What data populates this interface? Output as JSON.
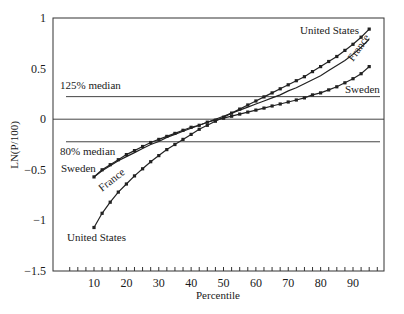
{
  "chart_data": {
    "type": "line",
    "title": "",
    "xlabel": "Percentile",
    "ylabel": "LN(P/100)",
    "xlim": [
      0,
      100
    ],
    "ylim": [
      -1.5,
      1
    ],
    "x_ticks": [
      10,
      20,
      30,
      40,
      50,
      60,
      70,
      80,
      90
    ],
    "x_tick_labels": [
      "10",
      "20",
      "30",
      "40",
      "50",
      "60",
      "70",
      "80",
      "90"
    ],
    "x_minor_step": 2.5,
    "y_ticks": [
      1,
      0.5,
      0,
      -0.5,
      -1,
      -1.5
    ],
    "y_tick_labels": [
      "1",
      "0.5",
      "0",
      "−0.5",
      "−1",
      "−1.5"
    ],
    "grid": false,
    "reference_lines": [
      {
        "name": "125% median",
        "y": 0.223,
        "label": "125% median"
      },
      {
        "name": "zero",
        "y": 0,
        "label": ""
      },
      {
        "name": "80% median",
        "y": -0.223,
        "label": "80% median"
      }
    ],
    "x": [
      10,
      12.5,
      15,
      17.5,
      20,
      22.5,
      25,
      27.5,
      30,
      32.5,
      35,
      37.5,
      40,
      42.5,
      45,
      47.5,
      50,
      52.5,
      55,
      57.5,
      60,
      62.5,
      65,
      67.5,
      70,
      72.5,
      75,
      77.5,
      80,
      82.5,
      85,
      87.5,
      90,
      92.5,
      95
    ],
    "series": [
      {
        "name": "United States",
        "markers": true,
        "values": [
          -1.07,
          -0.93,
          -0.82,
          -0.72,
          -0.64,
          -0.56,
          -0.49,
          -0.42,
          -0.36,
          -0.3,
          -0.25,
          -0.2,
          -0.15,
          -0.1,
          -0.06,
          -0.02,
          0.02,
          0.06,
          0.1,
          0.14,
          0.18,
          0.22,
          0.26,
          0.3,
          0.34,
          0.38,
          0.42,
          0.47,
          0.52,
          0.57,
          0.62,
          0.68,
          0.74,
          0.81,
          0.89
        ]
      },
      {
        "name": "France",
        "markers": false,
        "values": [
          -0.57,
          -0.51,
          -0.46,
          -0.41,
          -0.37,
          -0.33,
          -0.29,
          -0.25,
          -0.22,
          -0.18,
          -0.15,
          -0.12,
          -0.09,
          -0.06,
          -0.03,
          0.0,
          0.03,
          0.06,
          0.09,
          0.12,
          0.15,
          0.18,
          0.21,
          0.24,
          0.28,
          0.31,
          0.35,
          0.39,
          0.43,
          0.48,
          0.53,
          0.58,
          0.64,
          0.71,
          0.79
        ]
      },
      {
        "name": "Sweden",
        "markers": true,
        "values": [
          -0.57,
          -0.5,
          -0.45,
          -0.4,
          -0.35,
          -0.31,
          -0.27,
          -0.23,
          -0.2,
          -0.17,
          -0.14,
          -0.11,
          -0.08,
          -0.06,
          -0.03,
          -0.01,
          0.01,
          0.03,
          0.05,
          0.07,
          0.09,
          0.11,
          0.13,
          0.15,
          0.17,
          0.19,
          0.21,
          0.24,
          0.26,
          0.29,
          0.32,
          0.36,
          0.4,
          0.45,
          0.52
        ]
      }
    ],
    "annotations": [
      {
        "text": "United States",
        "near": "series-end-top",
        "series": "United States"
      },
      {
        "text": "France",
        "near": "series-end-rotated",
        "series": "France"
      },
      {
        "text": "Sweden",
        "near": "series-end-below",
        "series": "Sweden"
      },
      {
        "text": "Sweden",
        "near": "series-start-left",
        "series": "Sweden"
      },
      {
        "text": "France",
        "near": "series-start-rotated",
        "series": "France"
      },
      {
        "text": "United States",
        "near": "series-start-below",
        "series": "United States"
      }
    ]
  }
}
